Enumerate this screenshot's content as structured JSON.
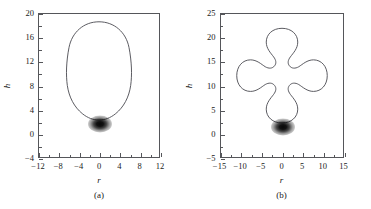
{
  "figure": {
    "colors": {
      "curve": "#4a4a50",
      "frame": "#55565a",
      "blob": "#0b0b0b",
      "background": "#ffffff"
    }
  },
  "chart_data": [
    {
      "type": "line",
      "panel": "a",
      "caption": "(a)",
      "title": "",
      "xlabel": "r",
      "ylabel": "h",
      "xlim": [
        -12,
        12
      ],
      "ylim": [
        -4,
        20
      ],
      "xticks": [
        -12,
        -8,
        -4,
        0,
        4,
        8,
        12
      ],
      "xtick_labels": [
        "−12",
        "−8",
        "−4",
        "0",
        "4",
        "8",
        "12"
      ],
      "yticks": [
        -4,
        0,
        4,
        8,
        12,
        16,
        20
      ],
      "ytick_labels": [
        "−4",
        "0",
        "4",
        "8",
        "12",
        "16",
        "20"
      ],
      "x_minor_step": 2,
      "y_minor_step": 2,
      "grid": false,
      "legend": "none",
      "series": [
        {
          "name": "equilibrium-interface-profile",
          "description": "closed egg-shaped interface contour",
          "r_max": 8.9,
          "r_min": -8.4,
          "h_top": 18.7,
          "h_bottom": -0.6,
          "widest_h": 8.5
        }
      ],
      "annotations": [
        {
          "name": "dark-blob",
          "type": "radial-gradient-spot",
          "r": 0.0,
          "h": -1.1,
          "r_radius": 2.3,
          "h_radius": 1.5
        }
      ]
    },
    {
      "type": "line",
      "panel": "b",
      "caption": "(b)",
      "title": "",
      "xlabel": "r",
      "ylabel": "h",
      "xlim": [
        -15,
        15
      ],
      "ylim": [
        -5,
        25
      ],
      "xticks": [
        -15,
        -10,
        -5,
        0,
        5,
        10,
        15
      ],
      "xtick_labels": [
        "−15",
        "−10",
        "−5",
        "0",
        "5",
        "10",
        "15"
      ],
      "yticks": [
        -5,
        0,
        5,
        10,
        15,
        20,
        25
      ],
      "ytick_labels": [
        "−5",
        "0",
        "5",
        "10",
        "15",
        "20",
        "25"
      ],
      "x_minor_step": 2.5,
      "y_minor_step": 2.5,
      "grid": false,
      "legend": "none",
      "series": [
        {
          "name": "equilibrium-interface-profile",
          "description": "closed four-lobed clover-shaped interface contour",
          "r_max": 10.2,
          "r_min": -10.2,
          "h_top": 22.0,
          "h_bottom": -0.5,
          "side_lobe_center_h": 10.8,
          "neck_r": 2.6
        }
      ],
      "annotations": [
        {
          "name": "dark-blob",
          "type": "radial-gradient-spot",
          "r": 0.0,
          "h": -1.0,
          "r_radius": 2.4,
          "h_radius": 1.6
        }
      ]
    }
  ]
}
